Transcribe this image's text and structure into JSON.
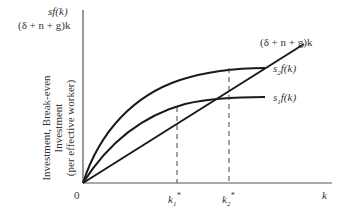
{
  "top_left_labels": {
    "line1": "sf(k)",
    "line2": "(δ + n + g)k"
  },
  "y_axis": {
    "label_lines": [
      "Investment, Break-even",
      "Investment",
      "(per effective worker)"
    ]
  },
  "x_axis": {
    "origin_label": "0",
    "k_label": "k",
    "ticks": [
      {
        "name": "k1-star",
        "base": "k",
        "sub": "1",
        "sup": "*"
      },
      {
        "name": "k2-star",
        "base": "k",
        "sub": "2",
        "sup": "*"
      }
    ]
  },
  "curves": {
    "breakeven": {
      "label": "(δ + n + g)k"
    },
    "s2f": {
      "base": "s",
      "sub": "2",
      "rest": "f(k)"
    },
    "s1f": {
      "base": "s",
      "sub": "1",
      "rest": "f(k)"
    }
  },
  "colors": {
    "line": "#1a1a1a",
    "dashed": "#444444",
    "text": "#333333"
  }
}
